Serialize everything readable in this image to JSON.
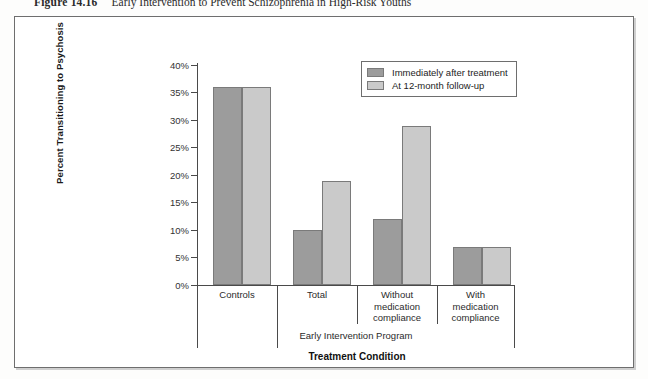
{
  "caption": {
    "figure_number": "Figure 14.16",
    "text": "Early Intervention to Prevent Schizophrenia in High-Risk Youths"
  },
  "chart_data": {
    "type": "bar",
    "title": "",
    "categories": [
      "Controls",
      "Total",
      "Without medication compliance",
      "With medication compliance"
    ],
    "series": [
      {
        "name": "Immediately after treatment",
        "values": [
          36,
          10,
          12,
          7
        ],
        "color": "#9c9c9c"
      },
      {
        "name": "At 12-month follow-up",
        "values": [
          36,
          19,
          29,
          7
        ],
        "color": "#cacaca"
      }
    ],
    "xlabel": "Treatment Condition",
    "ylabel": "Percent Transitioning to Psychosis",
    "ylim": [
      0,
      40
    ],
    "yticks": [
      "0%",
      "5%",
      "10%",
      "15%",
      "20%",
      "25%",
      "30%",
      "35%",
      "40%"
    ],
    "ytick_values": [
      0,
      5,
      10,
      15,
      20,
      25,
      30,
      35,
      40
    ],
    "group_label": "Early Intervention Program",
    "group_label_spans": [
      "Total",
      "Without medication compliance",
      "With medication compliance"
    ],
    "grid": false,
    "legend_position": "top-right"
  }
}
